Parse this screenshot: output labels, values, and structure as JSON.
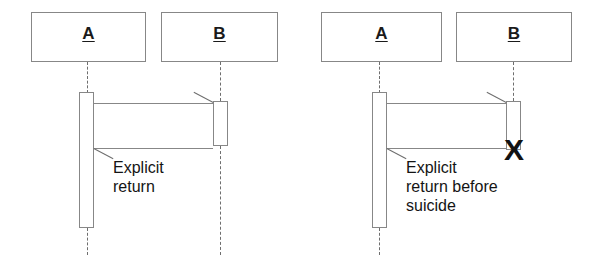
{
  "figure": {
    "kind": "uml-sequence-diagram",
    "background_color": "#ffffff",
    "line_color": "#878787",
    "text_color": "#141414",
    "marker_color": "#121212"
  },
  "panels": [
    {
      "id": "left",
      "caption": "Explicit\nreturn",
      "lifelines": [
        {
          "id": "a",
          "label": "A"
        },
        {
          "id": "b",
          "label": "B"
        }
      ],
      "messages": [
        {
          "id": "call",
          "direction": "right",
          "kind": "call"
        },
        {
          "id": "return",
          "direction": "left",
          "kind": "return"
        }
      ],
      "destruction_marker": ""
    },
    {
      "id": "right",
      "caption": "Explicit\nreturn before\nsuicide",
      "lifelines": [
        {
          "id": "a",
          "label": "A"
        },
        {
          "id": "b",
          "label": "B"
        }
      ],
      "messages": [
        {
          "id": "call",
          "direction": "right",
          "kind": "call"
        },
        {
          "id": "return",
          "direction": "left",
          "kind": "return"
        }
      ],
      "destruction_marker": "X"
    }
  ]
}
